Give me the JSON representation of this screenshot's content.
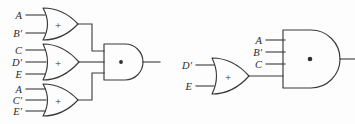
{
  "diagram": {
    "background_color": "#fdfdfd",
    "line_color": "#3a3a3a",
    "or_symbol": "+",
    "and_symbol": "·",
    "circuits": [
      {
        "name": "left-circuit",
        "gates": [
          {
            "id": "or1",
            "type": "or",
            "symbol": "+",
            "inputs": [
              "A",
              "B′"
            ]
          },
          {
            "id": "or2",
            "type": "or",
            "symbol": "+",
            "inputs": [
              "C",
              "D′",
              "E"
            ]
          },
          {
            "id": "or3",
            "type": "or",
            "symbol": "+",
            "inputs": [
              "A",
              "C′",
              "E′"
            ]
          },
          {
            "id": "and1",
            "type": "and",
            "symbol": "·",
            "inputs": [
              "or1",
              "or2",
              "or3"
            ]
          }
        ]
      },
      {
        "name": "right-circuit",
        "gates": [
          {
            "id": "or4",
            "type": "or",
            "symbol": "+",
            "inputs": [
              "D′",
              "E"
            ]
          },
          {
            "id": "and2",
            "type": "and",
            "symbol": "·",
            "inputs": [
              "A",
              "B′",
              "C",
              "or4"
            ]
          }
        ]
      }
    ],
    "labels": {
      "l_or1_in1": "A",
      "l_or1_in2": "B′",
      "l_or2_in1": "C",
      "l_or2_in2": "D′",
      "l_or2_in3": "E",
      "l_or3_in1": "A",
      "l_or3_in2": "C′",
      "l_or3_in3": "E′",
      "l_and2_in1": "A",
      "l_and2_in2": "B′",
      "l_and2_in3": "C",
      "l_or4_in1": "D′",
      "l_or4_in2": "E",
      "sym_or1": "+",
      "sym_or2": "+",
      "sym_or3": "+",
      "sym_or4": "+",
      "sym_and1": "·",
      "sym_and2": "·"
    }
  }
}
